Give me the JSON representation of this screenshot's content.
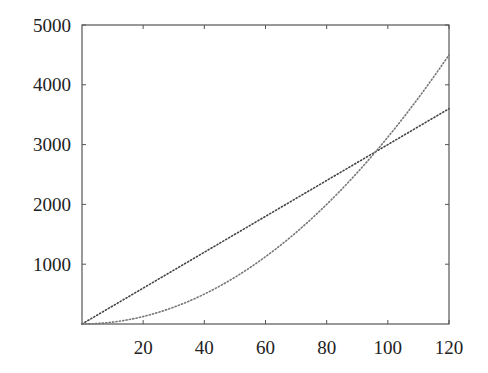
{
  "chart_data": {
    "type": "line",
    "title": "",
    "xlabel": "",
    "ylabel": "",
    "xlim": [
      0,
      120
    ],
    "ylim": [
      0,
      5000
    ],
    "grid": false,
    "legend": null,
    "x_ticks": [
      20,
      40,
      60,
      80,
      100,
      120
    ],
    "y_ticks": [
      1000,
      2000,
      3000,
      4000,
      5000
    ],
    "series": [
      {
        "name": "linear",
        "style": "dotted",
        "color": "#444444",
        "x": [
          0,
          20,
          40,
          60,
          80,
          100,
          120
        ],
        "y": [
          0,
          600,
          1200,
          1800,
          2400,
          3000,
          3600
        ]
      },
      {
        "name": "quadratic",
        "style": "dotted",
        "color": "#777777",
        "x": [
          0,
          20,
          40,
          60,
          80,
          100,
          120
        ],
        "y": [
          0,
          125,
          500,
          1125,
          2000,
          3125,
          4500
        ]
      }
    ]
  },
  "colors": {
    "axis": "#555555",
    "text": "#222222"
  }
}
